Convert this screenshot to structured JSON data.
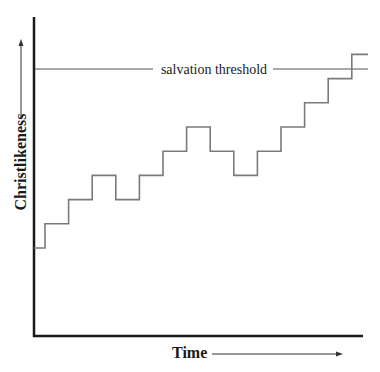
{
  "chart_data": {
    "type": "line",
    "subtype": "step",
    "title": "",
    "xlabel": "Time",
    "ylabel": "Christlikeness",
    "x_arrow": true,
    "y_arrow": true,
    "grid": false,
    "legend": null,
    "x": [
      0,
      1,
      2,
      3,
      4,
      5,
      6,
      7,
      8,
      9,
      10,
      11,
      12,
      13,
      14
    ],
    "values": [
      1,
      2,
      3,
      4,
      3,
      4,
      5,
      6,
      5,
      4,
      5,
      6,
      7,
      8,
      9
    ],
    "ylim": [
      -3.7,
      9.6
    ],
    "xlim": [
      0,
      14.5
    ],
    "threshold": {
      "label": "salvation threshold",
      "value": 8.4
    },
    "annotations": [
      "salvation threshold"
    ]
  },
  "labels": {
    "ylabel": "Christlikeness",
    "xlabel": "Time",
    "threshold": "salvation threshold"
  },
  "colors": {
    "axis": "#1a1a1a",
    "line": "#7a7a7a",
    "threshold": "#555555",
    "text": "#1a1a1a"
  }
}
